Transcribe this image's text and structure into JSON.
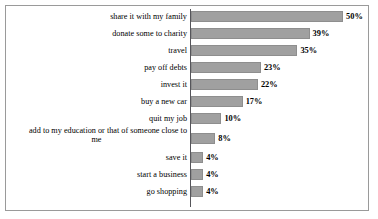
{
  "chart": {
    "type": "bar",
    "orientation": "horizontal",
    "title": "",
    "subtitle": "",
    "xlabel": "",
    "ylabel": "",
    "frame_border_color": "#9a9a9a",
    "bar_color": "#a0a0a0",
    "axis_color": "#55555a",
    "value_suffix": "%"
  },
  "chart_data": {
    "type": "bar",
    "title": "",
    "xlabel": "",
    "ylabel": "",
    "xlim": [
      0,
      50
    ],
    "grid": false,
    "legend": false,
    "orientation": "horizontal",
    "categories": [
      "share it with my family",
      "donate some to charity",
      "travel",
      "pay off debts",
      "invest it",
      "buy a new car",
      "quit my job",
      "add to my education or that of someone close to me",
      "save it",
      "start a business",
      "go shopping"
    ],
    "values": [
      50,
      39,
      35,
      23,
      22,
      17,
      10,
      8,
      4,
      4,
      4
    ],
    "data_labels": [
      "50%",
      "39%",
      "35%",
      "23%",
      "22%",
      "17%",
      "10%",
      "8%",
      "4%",
      "4%",
      "4%"
    ]
  },
  "rows": [
    {
      "label": "share it with my family",
      "label_line1": "share it with my family",
      "label_line2": "",
      "value": 50,
      "value_label": "50%"
    },
    {
      "label": "donate some to charity",
      "label_line1": "donate some to charity",
      "label_line2": "",
      "value": 39,
      "value_label": "39%"
    },
    {
      "label": "travel",
      "label_line1": "travel",
      "label_line2": "",
      "value": 35,
      "value_label": "35%"
    },
    {
      "label": "pay off debts",
      "label_line1": "pay off debts",
      "label_line2": "",
      "value": 23,
      "value_label": "23%"
    },
    {
      "label": "invest it",
      "label_line1": "invest it",
      "label_line2": "",
      "value": 22,
      "value_label": "22%"
    },
    {
      "label": "buy a new car",
      "label_line1": "buy a new car",
      "label_line2": "",
      "value": 17,
      "value_label": "17%"
    },
    {
      "label": "quit my job",
      "label_line1": "quit my job",
      "label_line2": "",
      "value": 10,
      "value_label": "10%"
    },
    {
      "label": "add to my education or that of someone close to me",
      "label_line1": "add to my education or that of someone close to",
      "label_line2": "me",
      "value": 8,
      "value_label": "8%"
    },
    {
      "label": "save it",
      "label_line1": "save it",
      "label_line2": "",
      "value": 4,
      "value_label": "4%"
    },
    {
      "label": "start a business",
      "label_line1": "start a business",
      "label_line2": "",
      "value": 4,
      "value_label": "4%"
    },
    {
      "label": "go shopping",
      "label_line1": "go shopping",
      "label_line2": "",
      "value": 4,
      "value_label": "4%"
    }
  ]
}
